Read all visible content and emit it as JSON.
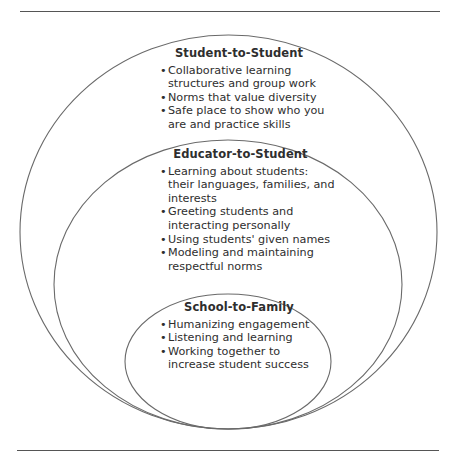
{
  "diagram": {
    "type": "nested-circles",
    "colors": {
      "stroke": "#6a6a6a",
      "text": "#2e2e2e",
      "rule": "#555555"
    },
    "layers": [
      {
        "title": "Student-to-Student",
        "items": [
          "Collaborative learning structures and group work",
          "Norms that value diversity",
          "Safe place to show who you are and practice skills"
        ]
      },
      {
        "title": "Educator-to-Student",
        "items": [
          "Learning about students: their languages, families, and interests",
          "Greeting students and interacting personally",
          "Using students' given names",
          "Modeling and maintaining respectful norms"
        ]
      },
      {
        "title": "School-to-Family",
        "items": [
          "Humanizing engagement",
          "Listening and learning",
          "Working together to increase student success"
        ]
      }
    ]
  }
}
